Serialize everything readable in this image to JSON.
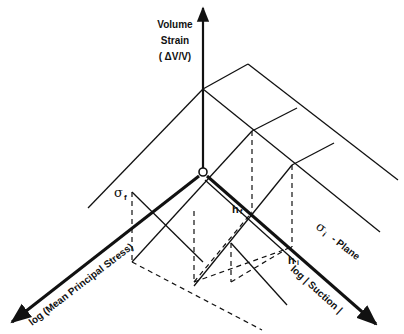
{
  "diagram": {
    "type": "3D constitutive surface sketch (volume strain vs. mean principal stress vs. suction)",
    "colors": {
      "line": "#111111",
      "background": "#ffffff"
    },
    "axes": {
      "vertical": {
        "line1": "Volume",
        "line2": "Strain",
        "line3": "( ΔV/V)"
      },
      "left": {
        "label": "log (Mean Principal Stress)"
      },
      "right": {
        "label": "log  | Suction |"
      }
    },
    "annotations": {
      "sigma_f": {
        "symbol": "σ",
        "subscript": "f"
      },
      "h_f": {
        "symbol": "h",
        "subscript": "f"
      },
      "h_i": {
        "symbol": "h",
        "subscript": "i"
      },
      "sigma_i_plane": {
        "symbol": "σ",
        "subscript": "i",
        "text": "- Plane"
      }
    }
  }
}
